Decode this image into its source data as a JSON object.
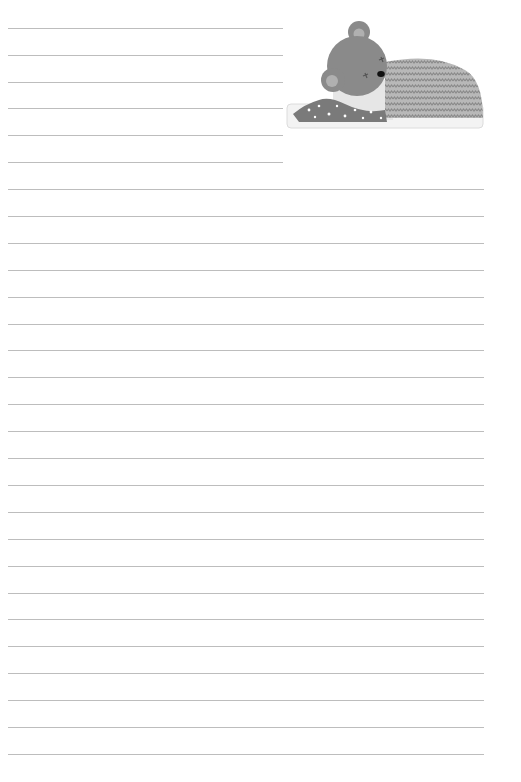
{
  "page": {
    "type": "lined-notepaper",
    "background": "#ffffff",
    "line_color": "#bdbdbd",
    "short_lines": {
      "count": 6,
      "start_y": 28,
      "spacing": 26.8,
      "x": 8,
      "width": 275
    },
    "full_lines": {
      "count": 22,
      "start_y": 189,
      "spacing": 26.9,
      "x": 8,
      "width": 476
    }
  },
  "illustration": {
    "subject": "sleeping-bear-icon",
    "description": "Grey bear sleeping under a zigzag-patterned blanket with a star-dotted pillow",
    "colors": {
      "bear": "#8a8a8a",
      "ear_inner": "#b5b5b5",
      "blanket": "#9c9c9c",
      "pillow": "#7d7d7d",
      "bed": "#f2f2f2"
    }
  }
}
